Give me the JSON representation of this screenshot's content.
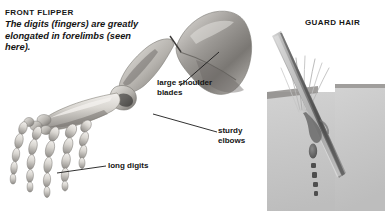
{
  "page": {
    "background": "#ffffff",
    "width": 385,
    "height": 211
  },
  "left_panel": {
    "heading": "FRONT FLIPPER",
    "description": "The digits (fingers) are greatly elongated in forelimbs (seen here).",
    "illustration": "whale-front-flipper-skeleton",
    "callouts": [
      {
        "id": "shoulder",
        "label": "large shoulder\nblades"
      },
      {
        "id": "elbows",
        "label": "sturdy\nelbows"
      },
      {
        "id": "digits",
        "label": "long digits"
      }
    ]
  },
  "right_panel": {
    "heading": "GUARD HAIR",
    "illustration": "guard-hair-in-skin-cross-section",
    "skin_block_color": "#c9c9c9",
    "hair_shaft_color": "#7d7d7d"
  },
  "colors": {
    "text": "#141414",
    "leader_line": "#1a1a1a",
    "bone_light": "#e3e1dd",
    "bone_mid": "#a9a6a2",
    "bone_dark": "#6d6a66"
  }
}
